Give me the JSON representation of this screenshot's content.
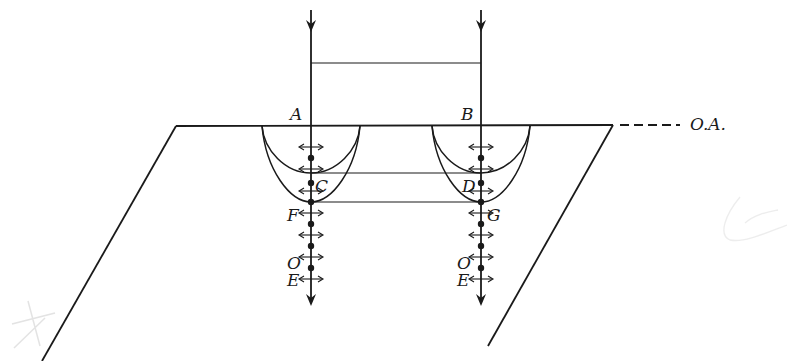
{
  "diagram": {
    "type": "birefringence-wavefront-construction",
    "colors": {
      "ink": "#1a1a1a",
      "background": "#ffffff",
      "smudge": "#d8d8d8"
    },
    "labels": {
      "A": "A",
      "B": "B",
      "C": "C",
      "D": "D",
      "F": "F",
      "G": "G",
      "O_left": "O",
      "E_left": "E",
      "O_right": "O",
      "E_right": "E",
      "optic_axis": "O.A."
    },
    "rays": [
      {
        "name": "left-ray",
        "x": 311,
        "entry_point": "A",
        "wavefront_points": [
          "C",
          "F"
        ]
      },
      {
        "name": "right-ray",
        "x": 481,
        "entry_point": "B",
        "wavefront_points": [
          "D",
          "G"
        ]
      }
    ],
    "connecting_lines": [
      {
        "name": "incident-wavefront",
        "y": 63
      },
      {
        "name": "ordinary-wavefront-CD",
        "y": 173
      },
      {
        "name": "extraordinary-wavefront-FG",
        "y": 202
      }
    ],
    "polarization_markers": {
      "dots_y": [
        158,
        183,
        202,
        224,
        246,
        268
      ],
      "double_arrows_y": [
        147,
        169,
        191,
        213,
        235,
        257,
        279
      ]
    },
    "emerging_beams": [
      "O (ordinary)",
      "E (extraordinary)"
    ]
  }
}
